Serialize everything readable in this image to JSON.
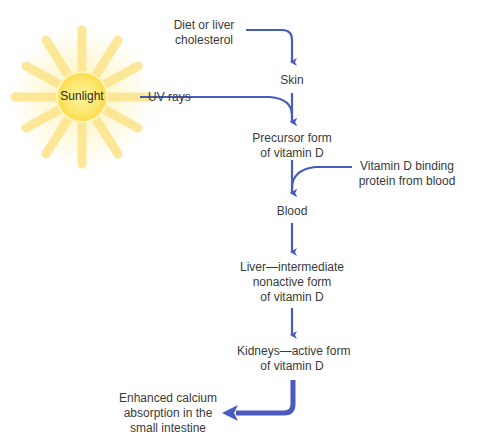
{
  "diagram": {
    "colors": {
      "arrow": "#4a5bbf",
      "sun_core": "#fde66a",
      "sun_rays": "#fce48a",
      "text": "#3a3a3a"
    },
    "sun": {
      "label": "Sunlight",
      "icon": "sun-icon"
    },
    "nodes": {
      "diet": {
        "line1": "Diet or liver",
        "line2": "cholesterol"
      },
      "uv": {
        "label": "UV rays"
      },
      "skin": {
        "label": "Skin"
      },
      "precursor": {
        "line1": "Precursor form",
        "line2": "of vitamin D"
      },
      "binding": {
        "line1": "Vitamin D binding",
        "line2": "protein from blood"
      },
      "blood": {
        "label": "Blood"
      },
      "liver": {
        "line1": "Liver—intermediate",
        "line2": "nonactive form",
        "line3": "of vitamin D"
      },
      "kidneys": {
        "line1": "Kidneys—active form",
        "line2": "of vitamin D"
      },
      "calcium": {
        "line1": "Enhanced calcium",
        "line2": "absorption in the",
        "line3": "small intestine"
      }
    },
    "edges": [
      {
        "from": "Diet or liver cholesterol",
        "to": "Skin"
      },
      {
        "from": "Sunlight (UV rays)",
        "to": "Precursor form of vitamin D"
      },
      {
        "from": "Skin",
        "to": "Precursor form of vitamin D"
      },
      {
        "from": "Vitamin D binding protein from blood",
        "to": "Blood"
      },
      {
        "from": "Precursor form of vitamin D",
        "to": "Blood"
      },
      {
        "from": "Blood",
        "to": "Liver—intermediate nonactive form of vitamin D"
      },
      {
        "from": "Liver—intermediate nonactive form of vitamin D",
        "to": "Kidneys—active form of vitamin D"
      },
      {
        "from": "Kidneys—active form of vitamin D",
        "to": "Enhanced calcium absorption in the small intestine"
      }
    ]
  }
}
